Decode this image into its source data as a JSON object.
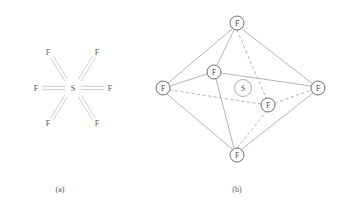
{
  "figure": {
    "background_color": "#ffffff",
    "line_color": "#8c8c8c",
    "text_color": "#555555",
    "panels": [
      {
        "id": "a",
        "caption": "(a)",
        "caption_x": 60,
        "caption_y": 189,
        "type": "lewis-structure",
        "center_atom": {
          "label": "S",
          "x": 73,
          "y": 88
        },
        "ligand_atoms": [
          {
            "label": "F",
            "x": 48,
            "y": 52,
            "position": "upper-left"
          },
          {
            "label": "F",
            "x": 97,
            "y": 52,
            "position": "upper-right"
          },
          {
            "label": "F",
            "x": 36,
            "y": 88,
            "position": "left"
          },
          {
            "label": "F",
            "x": 110,
            "y": 88,
            "position": "right"
          },
          {
            "label": "F",
            "x": 48,
            "y": 123,
            "position": "lower-left"
          },
          {
            "label": "F",
            "x": 97,
            "y": 123,
            "position": "lower-right"
          }
        ],
        "bonds": [
          {
            "from": "S",
            "to": "F-upper-left",
            "x1": 66,
            "y1": 82,
            "x2": 52,
            "y2": 58,
            "style": "double-outline"
          },
          {
            "from": "S",
            "to": "F-upper-right",
            "x1": 80,
            "y1": 82,
            "x2": 94,
            "y2": 58,
            "style": "double-outline"
          },
          {
            "from": "S",
            "to": "F-left",
            "x1": 65,
            "y1": 88,
            "x2": 42,
            "y2": 88,
            "style": "double-outline"
          },
          {
            "from": "S",
            "to": "F-right",
            "x1": 81,
            "y1": 88,
            "x2": 104,
            "y2": 88,
            "style": "double-outline"
          },
          {
            "from": "S",
            "to": "F-lower-left",
            "x1": 66,
            "y1": 94,
            "x2": 52,
            "y2": 117,
            "style": "double-outline"
          },
          {
            "from": "S",
            "to": "F-lower-right",
            "x1": 80,
            "y1": 94,
            "x2": 94,
            "y2": 117,
            "style": "double-outline"
          }
        ]
      },
      {
        "id": "b",
        "caption": "(b)",
        "caption_x": 237,
        "caption_y": 189,
        "type": "octahedron-3d",
        "center_atom": {
          "label": "S",
          "x": 243,
          "y": 88,
          "radius": 8.5
        },
        "vertices": [
          {
            "label": "F",
            "x": 237,
            "y": 23,
            "radius": 7,
            "position": "top"
          },
          {
            "label": "F",
            "x": 163,
            "y": 88,
            "radius": 7,
            "position": "left"
          },
          {
            "label": "F",
            "x": 318,
            "y": 88,
            "radius": 7,
            "position": "right"
          },
          {
            "label": "F",
            "x": 214,
            "y": 72,
            "radius": 7,
            "position": "front"
          },
          {
            "label": "F",
            "x": 268,
            "y": 105,
            "radius": 7,
            "position": "back"
          },
          {
            "label": "F",
            "x": 237,
            "y": 155,
            "radius": 7,
            "position": "bottom"
          }
        ],
        "edges": [
          {
            "from": "top",
            "to": "left",
            "style": "solid"
          },
          {
            "from": "top",
            "to": "right",
            "style": "solid"
          },
          {
            "from": "top",
            "to": "front",
            "style": "solid"
          },
          {
            "from": "top",
            "to": "back",
            "style": "dashed"
          },
          {
            "from": "bottom",
            "to": "left",
            "style": "solid"
          },
          {
            "from": "bottom",
            "to": "right",
            "style": "solid"
          },
          {
            "from": "bottom",
            "to": "front",
            "style": "solid"
          },
          {
            "from": "bottom",
            "to": "back",
            "style": "dashed"
          },
          {
            "from": "left",
            "to": "front",
            "style": "solid"
          },
          {
            "from": "front",
            "to": "right",
            "style": "solid"
          },
          {
            "from": "right",
            "to": "back",
            "style": "dashed"
          },
          {
            "from": "back",
            "to": "left",
            "style": "dashed"
          }
        ]
      }
    ]
  }
}
